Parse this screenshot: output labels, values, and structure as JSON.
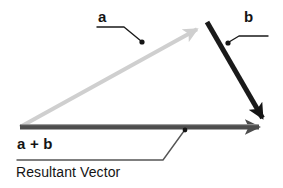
{
  "figure": {
    "background_color": "#ffffff",
    "width": 283,
    "height": 188,
    "labels": {
      "vector_a": "a",
      "vector_b": "b",
      "resultant_expression": "a + b",
      "resultant_caption": "Resultant Vector"
    },
    "colors": {
      "vector_a": "#cfcfcf",
      "vector_b": "#1a1a1a",
      "resultant": "#4d4d4d",
      "leader_line": "#1a1a1a",
      "underline": "#555555",
      "text": "#141414"
    },
    "vectors": [
      {
        "name": "a",
        "label": "a",
        "color": "#cfcfcf",
        "from": [
          20,
          127
        ],
        "to": [
          201,
          27
        ],
        "style": "light-gray-arrow",
        "thickness": 4
      },
      {
        "name": "b",
        "label": "b",
        "color": "#1a1a1a",
        "from": [
          207,
          22
        ],
        "to": [
          266,
          124
        ],
        "style": "black-arrow",
        "thickness": 5
      },
      {
        "name": "a + b",
        "label": "a + b",
        "color": "#4d4d4d",
        "from": [
          20,
          127
        ],
        "to": [
          267,
          127
        ],
        "style": "dark-gray-arrow",
        "thickness": 5
      }
    ],
    "annotations": [
      {
        "name": "leader-a",
        "label": "a",
        "dot": [
          142,
          42
        ],
        "elbow": [
          124,
          27
        ],
        "end": [
          97,
          27
        ]
      },
      {
        "name": "leader-b",
        "label": "b",
        "dot": [
          228,
          43
        ],
        "elbow": [
          239,
          36
        ],
        "end": [
          268,
          36
        ]
      },
      {
        "name": "leader-resultant",
        "label": "a + b",
        "dot": [
          185,
          130
        ],
        "elbow": [
          163,
          160
        ],
        "end": [
          17,
          160
        ]
      }
    ]
  }
}
